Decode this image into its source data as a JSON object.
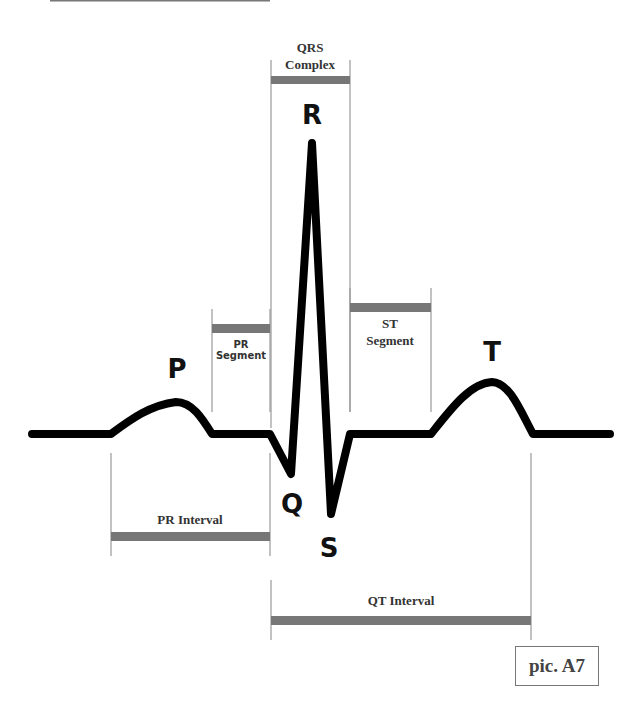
{
  "diagram": {
    "title_rule": true,
    "waves": {
      "p": "P",
      "q": "Q",
      "r": "R",
      "s": "S",
      "t": "T"
    },
    "labels": {
      "qrs_line1": "QRS",
      "qrs_line2": "Complex",
      "pr_segment_line1": "PR",
      "pr_segment_line2": "Segment",
      "st_segment_line1": "ST",
      "st_segment_line2": "Segment",
      "pr_interval": "PR Interval",
      "qt_interval": "QT Interval"
    },
    "caption": "pic. A7",
    "colors": {
      "trace": "#000000",
      "bar": "#777777",
      "guide": "#888888",
      "text": "#333333"
    }
  }
}
